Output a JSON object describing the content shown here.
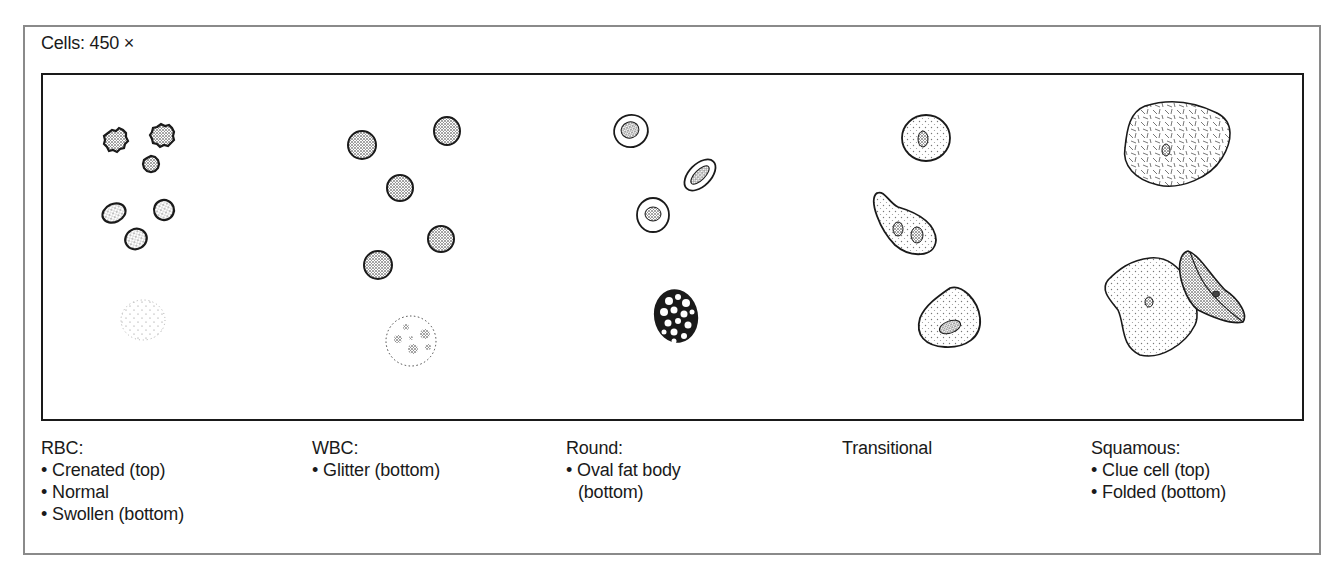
{
  "figure": {
    "title": "Cells: 450 ×",
    "panels": [
      {
        "id": "rbc",
        "label": "RBC:",
        "items": [
          "Crenated (top)",
          "Normal",
          "Swollen (bottom)"
        ]
      },
      {
        "id": "wbc",
        "label": "WBC:",
        "items": [
          "Glitter (bottom)"
        ]
      },
      {
        "id": "round",
        "label": "Round:",
        "items": [
          "Oval fat body"
        ],
        "item_continuation": "(bottom)"
      },
      {
        "id": "transitional",
        "label": "Transitional",
        "items": []
      },
      {
        "id": "squamous",
        "label": "Squamous:",
        "items": [
          "Clue cell (top)",
          "Folded (bottom)"
        ]
      }
    ]
  },
  "colors": {
    "ink": "#1a1a1a",
    "frame": "#8a8a8a",
    "background": "#ffffff"
  }
}
